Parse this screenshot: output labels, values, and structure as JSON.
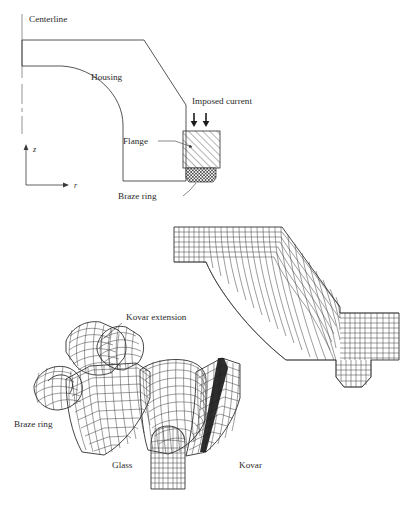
{
  "figure": {
    "background_color": "#ffffff",
    "line_color": "#2b2b2b"
  },
  "schematic": {
    "name": "cross-section-schematic",
    "labels": {
      "centerline": "Centerline",
      "housing": "Housing",
      "flange": "Flange",
      "braze_ring": "Braze ring",
      "imposed_current": "Imposed current"
    },
    "axes": {
      "vertical": "z",
      "horizontal": "r"
    },
    "arrows": {
      "count": 2,
      "direction": "down"
    },
    "hatching": {
      "flange": "diagonal-hatch",
      "braze_ring": "cross-hatch"
    }
  },
  "mesh_upper": {
    "name": "housing-fe-mesh",
    "description": "Finite element mesh of housing elbow with flange extension"
  },
  "mesh_lower": {
    "name": "assembly-3d-mesh",
    "labels": {
      "kovar_extension": "Kovar extension",
      "braze_ring": "Braze ring",
      "glass": "Glass",
      "kovar": "Kovar"
    }
  },
  "caption": {
    "text": ""
  }
}
